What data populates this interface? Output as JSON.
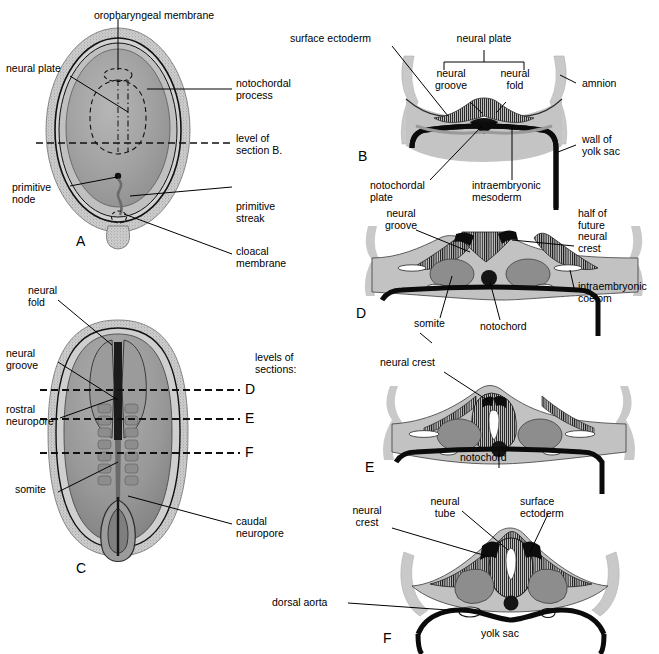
{
  "figure": {
    "panels": [
      {
        "id": "A",
        "letter": "A",
        "caption": "Dorsal view of embryonic disc at about 18 days"
      },
      {
        "id": "B",
        "letter": "B",
        "caption": "Transverse section through neural plate"
      },
      {
        "id": "C",
        "letter": "C",
        "caption": "Dorsal view of embryo at about 22 days"
      },
      {
        "id": "D",
        "letter": "D",
        "caption": "Transverse section with neural groove and somites"
      },
      {
        "id": "E",
        "letter": "E",
        "caption": "Transverse section with neural folds fusing"
      },
      {
        "id": "F",
        "letter": "F",
        "caption": "Transverse section with closed neural tube"
      }
    ]
  },
  "colors": {
    "ink": "#000000",
    "ectoderm_gray": "#b8b8b8",
    "amnion_gray": "#c9c9c9",
    "mesoderm_gray": "#9a9a9a",
    "somite_gray": "#8a8a8a",
    "disc_fill": "#a9a9a9",
    "disc_rim": "#c4c4c4",
    "background": "#ffffff"
  },
  "labels": {
    "A": {
      "oropharyngeal_membrane": "oropharyngeal membrane",
      "neural_plate": "neural plate",
      "notochordal_process": "notochordal\nprocess",
      "level_of_section_b": "level of\nsection B.",
      "primitive_node": "primitive\nnode",
      "primitive_streak": "primitive\nstreak",
      "cloacal_membrane": "cloacal\nmembrane",
      "letter": "A"
    },
    "B": {
      "surface_ectoderm": "surface ectoderm",
      "neural_plate": "neural plate",
      "neural_groove": "neural\ngroove",
      "neural_fold": "neural\nfold",
      "amnion": "amnion",
      "wall_of_yolk_sac": "wall of\nyolk sac",
      "notochordal_plate": "notochordal\nplate",
      "intraembryonic_mesoderm": "intraembryonic\nmesoderm",
      "letter": "B"
    },
    "C": {
      "neural_fold": "neural\nfold",
      "neural_groove": "neural\ngroove",
      "rostral_neuropore": "rostral\nneuropore",
      "somite": "somite",
      "caudal_neuropore": "caudal\nneuropore",
      "levels_of_sections": "levels of\nsections:",
      "level_d": "D",
      "level_e": "E",
      "level_f": "F",
      "letter": "C"
    },
    "D": {
      "neural_groove": "neural\ngroove",
      "half_of_future_neural_crest": "half of\nfuture\nneural\ncrest",
      "intraembryonic_coelom": "intraembryonic\ncoelom",
      "somite": "somite",
      "notochord": "notochord",
      "letter": "D"
    },
    "E": {
      "neural_crest": "neural crest",
      "notochord": "notochord",
      "letter": "E"
    },
    "F": {
      "neural_crest": "neural\ncrest",
      "neural_tube": "neural\ntube",
      "surface_ectoderm": "surface\nectoderm",
      "dorsal_aorta": "dorsal aorta",
      "yolk_sac": "yolk sac",
      "letter": "F"
    }
  }
}
